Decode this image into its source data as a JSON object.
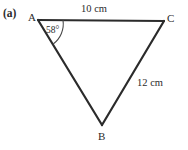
{
  "figure": {
    "part_label": "(a)",
    "background_color": "#ffffff",
    "stroke_color": "#2b2b2b",
    "vertices": [
      {
        "name": "A",
        "label": "A",
        "x": 38,
        "y": 20
      },
      {
        "name": "C",
        "label": "C",
        "x": 164,
        "y": 21
      },
      {
        "name": "B",
        "label": "B",
        "x": 102,
        "y": 125
      }
    ],
    "sides": [
      {
        "name": "AC",
        "label": "10 cm",
        "length": 10,
        "unit": "cm"
      },
      {
        "name": "BC",
        "label": "12 cm",
        "length": 12,
        "unit": "cm"
      },
      {
        "name": "AB",
        "label": "",
        "length": null,
        "unit": ""
      }
    ],
    "angles": [
      {
        "at": "A",
        "label": "58°",
        "value": 58,
        "unit": "degree"
      }
    ]
  }
}
